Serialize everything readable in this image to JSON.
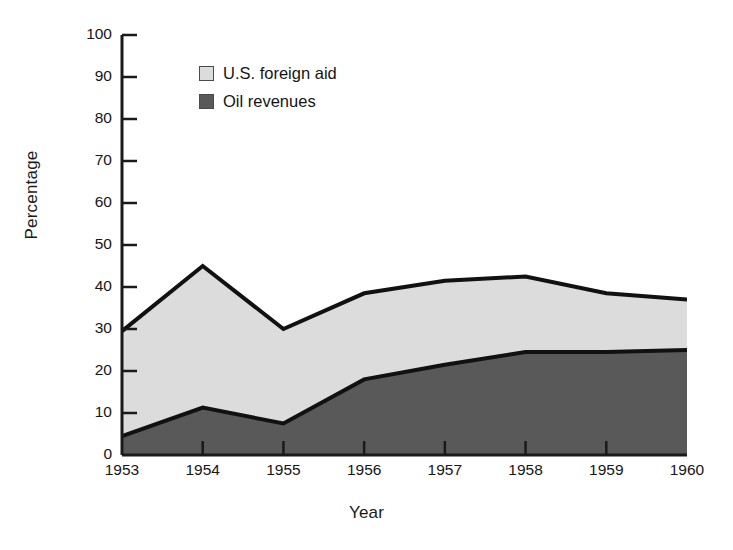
{
  "chart_data": {
    "type": "area",
    "title": "",
    "xlabel": "Year",
    "ylabel": "Percentage",
    "categories": [
      "1953",
      "1954",
      "1955",
      "1956",
      "1957",
      "1958",
      "1959",
      "1960"
    ],
    "x": [
      1953,
      1954,
      1955,
      1956,
      1957,
      1958,
      1959,
      1960
    ],
    "stacked": true,
    "ylim": [
      0,
      100
    ],
    "xlim": [
      1953,
      1960
    ],
    "yticks": [
      0,
      10,
      20,
      30,
      40,
      50,
      60,
      70,
      80,
      90,
      100
    ],
    "ytick_labels": [
      "0",
      "10",
      "20",
      "30",
      "40",
      "50",
      "60",
      "70",
      "80",
      "90",
      "100"
    ],
    "xtick_labels": [
      "1953",
      "1954",
      "1955",
      "1956",
      "1957",
      "1958",
      "1959",
      "1960"
    ],
    "grid": false,
    "legend_position": "top-left-inside",
    "series": [
      {
        "name": "Oil revenues",
        "color": "#595959",
        "values": [
          4.5,
          11.3,
          7.5,
          18.0,
          21.5,
          24.5,
          24.5,
          25.0
        ]
      },
      {
        "name": "U.S. foreign aid",
        "color": "#dcdcdc",
        "values": [
          25.0,
          33.7,
          22.5,
          20.5,
          20.0,
          18.0,
          14.0,
          12.0
        ]
      }
    ],
    "cumulative_totals": [
      29.5,
      45.0,
      30.0,
      38.5,
      41.5,
      42.5,
      38.5,
      37.0
    ],
    "annotations": []
  },
  "legend": {
    "items": [
      {
        "label": "U.S. foreign aid",
        "swatch_color": "#dcdcdc"
      },
      {
        "label": "Oil revenues",
        "swatch_color": "#595959"
      }
    ]
  },
  "axes": {
    "y_title": "Percentage",
    "x_title": "Year"
  },
  "colors": {
    "foreign_aid": "#dcdcdc",
    "oil_revenues": "#595959",
    "outline": "#111111",
    "axis": "#1a1a1a",
    "background": "#ffffff"
  }
}
